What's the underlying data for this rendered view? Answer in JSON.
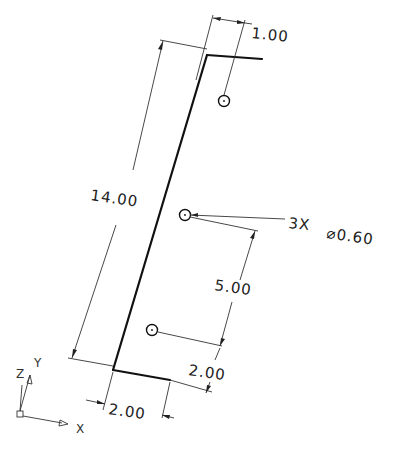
{
  "drawing": {
    "type": "2D engineering drawing (rotated part view)",
    "dimensions": {
      "top_offset": "1.00",
      "overall_length": "14.00",
      "hole_spacing": "5.00",
      "bottom_hole_offset": "2.00",
      "bottom_width": "2.00"
    },
    "callout": {
      "count": "3X",
      "diameter": "⌀0.60"
    },
    "axes": {
      "x_label": "X",
      "y_label": "Y",
      "z_label": "Z"
    },
    "colors": {
      "line": "#111111",
      "background": "#ffffff"
    }
  }
}
